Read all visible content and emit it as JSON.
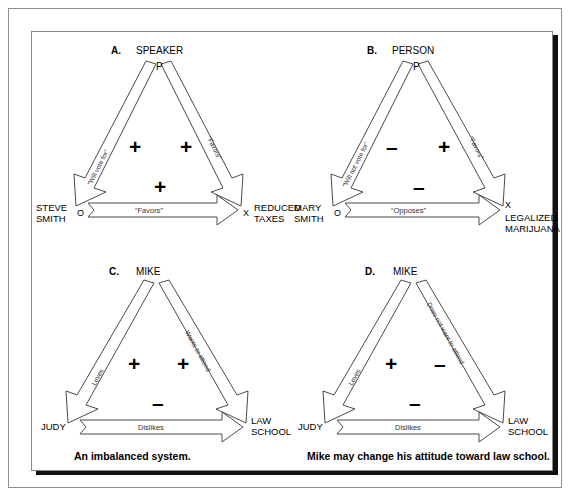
{
  "figure": {
    "type": "balance-theory-diagrams",
    "panels": [
      {
        "letter": "A.",
        "apex_label": "SPEAKER",
        "apex_mark": "P",
        "left_vertex": "STEVE\nSMITH",
        "left_mark": "O",
        "right_vertex": "REDUCED\nTAXES",
        "right_mark": "X",
        "left_edge_label": "“Will vote for”",
        "left_edge_sign": "+",
        "right_edge_label": "“Favors”",
        "right_edge_sign": "+",
        "bottom_edge_label": "“Favors”",
        "bottom_edge_sign": "+",
        "caption": ""
      },
      {
        "letter": "B.",
        "apex_label": "PERSON",
        "apex_mark": "P",
        "left_vertex": "MARY\nSMITH",
        "left_mark": "O",
        "right_vertex": "LEGALIZED\nMARIJUANA",
        "right_mark": "X",
        "left_edge_label": "“Will not vote for”",
        "left_edge_sign": "–",
        "right_edge_label": "“Favors”",
        "right_edge_sign": "+",
        "bottom_edge_label": "“Opposes”",
        "bottom_edge_sign": "–",
        "caption": ""
      },
      {
        "letter": "C.",
        "apex_label": "MIKE",
        "apex_mark": "",
        "left_vertex": "JUDY",
        "left_mark": "",
        "right_vertex": "LAW\nSCHOOL",
        "right_mark": "",
        "left_edge_label": "Loves",
        "left_edge_sign": "+",
        "right_edge_label": "Wants to attend",
        "right_edge_sign": "+",
        "bottom_edge_label": "Dislikes",
        "bottom_edge_sign": "–",
        "caption": "An imbalanced system."
      },
      {
        "letter": "D.",
        "apex_label": "MIKE",
        "apex_mark": "",
        "left_vertex": "JUDY",
        "left_mark": "",
        "right_vertex": "LAW\nSCHOOL",
        "right_mark": "",
        "left_edge_label": "Loves",
        "left_edge_sign": "+",
        "right_edge_label": "Does not want to attend",
        "right_edge_sign": "–",
        "bottom_edge_label": "Dislikes",
        "bottom_edge_sign": "–",
        "caption": "Mike may change his attitude toward law school."
      }
    ],
    "colors": {
      "ink": "#000000",
      "arrow_fill": "#ffffff",
      "arrow_stroke": "#4a4a4a",
      "frame": "#8a8a8a",
      "shadow": "#111111",
      "background": "#ffffff"
    }
  }
}
